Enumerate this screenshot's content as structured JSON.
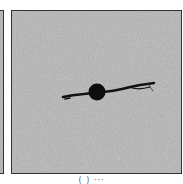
{
  "figure": {
    "panels": [
      {
        "id": "left",
        "description": "partially visible grayscale micrograph panel (cropped)"
      },
      {
        "id": "main",
        "description": "grayscale speckled micrograph with dark circular pore and horizontal crack"
      }
    ],
    "caption": "( ) ···"
  }
}
